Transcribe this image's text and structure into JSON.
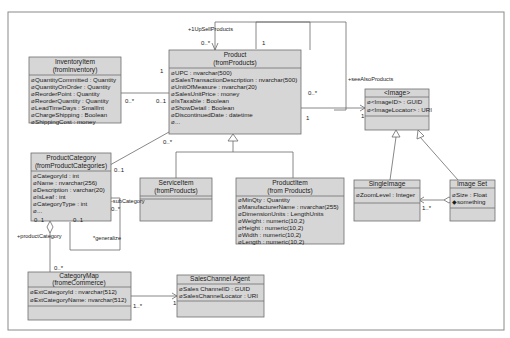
{
  "diagram": {
    "type": "UML class diagram",
    "classes": [
      {
        "id": "inventory",
        "name": "InventoryItem",
        "package": "(fromInventory)",
        "attributes": [
          "QuantityCommitted : Quantity",
          "QuantityOnOrder : Quantity",
          "ReorderPoint : Quantity",
          "ReorderQuantity : Quantity",
          "LeadTimeDays : SmallInt",
          "ChargeShipping : Boolean",
          "ShippingCost : money"
        ]
      },
      {
        "id": "product",
        "name": "Product",
        "package": "(fromProducts)",
        "attributes": [
          "UPC : nvarchar(500)",
          "SalesTransactionDescription : nvarchar(500)",
          "UnitOfMeasure : nvarchar(20)",
          "SalesUnitPrice : money",
          "IsTaxable : Boolean",
          "ShowDetail : Boolean",
          "DiscontinuedDate : datetime",
          "..."
        ]
      },
      {
        "id": "image",
        "name": "<Image>",
        "package": "",
        "attributes": [
          "<ImageID> : GUID",
          "<ImageLocator> : URI"
        ]
      },
      {
        "id": "category",
        "name": "ProductCategory",
        "package": "(fromProductCategories)",
        "attributes": [
          "CategoryId : int",
          "Name : nvarchar(256)",
          "Description : varchar(20)",
          "IsLeaf : int",
          "CategoryType : int",
          "..."
        ]
      },
      {
        "id": "service",
        "name": "ServiceItem",
        "package": "(fromProducts)",
        "attributes": []
      },
      {
        "id": "productitem",
        "name": "ProductItem",
        "package": "(from Products)",
        "attributes": [
          "MinQty : Quantity",
          "ManufacturerName : nvarchar(255)",
          "DimensionUnits : LengthUnits",
          "Weight : numeric(10,2)",
          "Height : numeric(10,2)",
          "Width : numeric(10,2)",
          "Length : numeric(10,2)"
        ]
      },
      {
        "id": "single",
        "name": "SingleImage",
        "package": "",
        "attributes": [
          "ZoomLevel : Integer"
        ]
      },
      {
        "id": "imageset",
        "name": "Image Set",
        "package": "",
        "attributes": [
          "Size : Float",
          "something"
        ]
      },
      {
        "id": "catmap",
        "name": "CategoryMap",
        "package": "(fromeCommerce)",
        "attributes": [
          "ExtCategoryId : nvarchar(512)",
          "ExtCategoryName: nvarchar(512)"
        ]
      },
      {
        "id": "sales",
        "name": "SalesChannel Agent",
        "package": "",
        "attributes": [
          "Sales ChannelID : GUID",
          "SalesChannelLocator : URI"
        ]
      }
    ],
    "labels": {
      "upsell_role": "+1UpSellProducts",
      "seealso_role": "+seeAlsoProducts",
      "subcategory_role": "-subCategory",
      "generalize_role": "*generalize",
      "productcategory_role": "+productCategory"
    },
    "multiplicities": {
      "upsell_top": "0..*",
      "upsell_right": "1",
      "seealso_right": "0..*",
      "seealso_bottom": "1",
      "inv_left": "1",
      "inv_mid": "0..*",
      "inv_prod": "0..1",
      "cat_prod": "0..*",
      "cat_self": "0..1",
      "sub_cat": "0..*",
      "gen_cat": "0..1",
      "cat_agg": "0..1",
      "catmap_top": "0..*",
      "catmap_right": "1..*",
      "sales_left": "1",
      "image_left": "1",
      "imageset_single": "1..*"
    },
    "colors": {
      "box_fill": "#d6d6d6",
      "border": "#6e6e6e",
      "frame": "#8a8a8a"
    }
  }
}
